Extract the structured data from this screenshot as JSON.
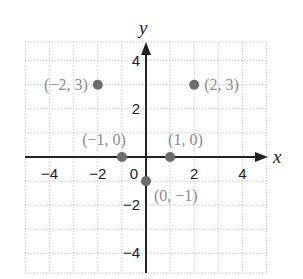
{
  "chart_data": {
    "type": "scatter",
    "title": "",
    "xlabel": "x",
    "ylabel": "y",
    "xlim": [
      -5,
      5
    ],
    "ylim": [
      -5,
      4.8
    ],
    "grid": true,
    "x_ticks": [
      {
        "value": -4,
        "label": "−4"
      },
      {
        "value": -2,
        "label": "−2"
      },
      {
        "value": 0,
        "label": "0"
      },
      {
        "value": 2,
        "label": "2"
      },
      {
        "value": 4,
        "label": "4"
      }
    ],
    "y_ticks": [
      {
        "value": 4,
        "label": "4"
      },
      {
        "value": 2,
        "label": "2"
      },
      {
        "value": -2,
        "label": "−2"
      },
      {
        "value": -4,
        "label": "−4"
      }
    ],
    "points": [
      {
        "x": -2,
        "y": 3,
        "label": "(−2, 3)",
        "label_pos": "left"
      },
      {
        "x": 2,
        "y": 3,
        "label": "(2, 3)",
        "label_pos": "right"
      },
      {
        "x": -1,
        "y": 0,
        "label": "(−1, 0)",
        "label_pos": "above-left"
      },
      {
        "x": 1,
        "y": 0,
        "label": "(1, 0)",
        "label_pos": "above-right"
      },
      {
        "x": 0,
        "y": -1,
        "label": "(0, −1)",
        "label_pos": "below-right"
      }
    ],
    "colors": {
      "point": "#6b6b6b",
      "point_label": "#8a8a8a",
      "axis": "#222222",
      "grid": "#c8c8c8"
    }
  }
}
